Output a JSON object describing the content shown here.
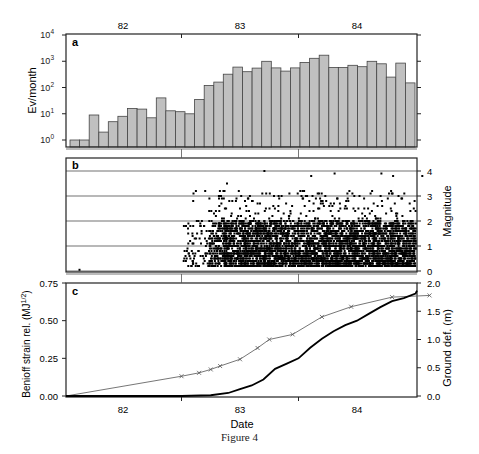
{
  "figure": {
    "caption": "Figure 4",
    "top_axis_ticks": [
      "82",
      "83",
      "84"
    ],
    "bottom_axis_ticks": [
      "82",
      "83",
      "84"
    ],
    "xlabel": "Date"
  },
  "chart_data": [
    {
      "panel": "a",
      "type": "bar",
      "title": "",
      "xlabel": "",
      "ylabel": "Ev/month",
      "yscale": "log",
      "ylim": [
        0.5,
        10000
      ],
      "yticks": [
        "10^0",
        "10^1",
        "10^2",
        "10^3",
        "10^4"
      ],
      "xticks": [
        "82",
        "83",
        "84"
      ],
      "x_start": 81.58,
      "bin_months": 1,
      "values": [
        1,
        1,
        9,
        2,
        5,
        8,
        16,
        15,
        7,
        40,
        13,
        12,
        10,
        35,
        120,
        160,
        320,
        600,
        400,
        550,
        1000,
        560,
        420,
        560,
        900,
        1300,
        1700,
        580,
        580,
        700,
        620,
        1000,
        800,
        250,
        850,
        150
      ],
      "bar_color": "#c0c0c0",
      "grid": false
    },
    {
      "panel": "b",
      "type": "scatter",
      "ylabel": "Magnitude",
      "ylim": [
        0,
        4.4
      ],
      "yticks": [
        "0",
        "1",
        "2",
        "3",
        "4"
      ],
      "grid": "horizontal",
      "description": "Dense earthquake magnitudes from ~82.5 to ~84.6, mostly 0.2-2, scattered up to ~4",
      "notable_points": [
        [
          81.62,
          0.05
        ],
        [
          83.2,
          4.0
        ],
        [
          83.6,
          3.8
        ],
        [
          83.8,
          3.9
        ],
        [
          84.2,
          3.9
        ],
        [
          84.3,
          3.8
        ],
        [
          84.55,
          3.8
        ],
        [
          82.88,
          3.5
        ],
        [
          82.82,
          3.2
        ]
      ],
      "marker_color": "#000000"
    },
    {
      "panel": "c",
      "type": "line",
      "ylabel": "Benioff strain rel. (MJ^1/2)",
      "ylim": [
        0,
        0.75
      ],
      "yticks": [
        "0.00",
        "0.25",
        "0.50",
        "0.75"
      ],
      "y2label": "Ground def. (m)",
      "y2lim": [
        0,
        2.0
      ],
      "y2ticks": [
        "0.0",
        "0.5",
        "1.0",
        "1.5",
        "2.0"
      ],
      "series": [
        {
          "name": "Benioff strain release",
          "axis": "left",
          "style": "thick black line",
          "x": [
            82.5,
            82.75,
            82.9,
            83.0,
            83.1,
            83.2,
            83.3,
            83.4,
            83.5,
            83.6,
            83.7,
            83.8,
            83.9,
            84.0,
            84.1,
            84.2,
            84.3,
            84.4,
            84.5,
            84.62
          ],
          "y": [
            0.0,
            0.005,
            0.02,
            0.045,
            0.07,
            0.11,
            0.18,
            0.215,
            0.25,
            0.32,
            0.38,
            0.43,
            0.47,
            0.5,
            0.545,
            0.59,
            0.63,
            0.65,
            0.68,
            0.7
          ]
        },
        {
          "name": "Ground deformation",
          "axis": "right",
          "style": "thin gray line with x markers",
          "x": [
            81.6,
            82.5,
            82.65,
            82.75,
            82.83,
            83.0,
            83.15,
            83.25,
            83.45,
            83.7,
            83.95,
            84.3,
            84.62
          ],
          "y": [
            0.0,
            0.35,
            0.41,
            0.47,
            0.53,
            0.65,
            0.85,
            1.0,
            1.09,
            1.4,
            1.58,
            1.75,
            1.78
          ]
        }
      ]
    }
  ]
}
